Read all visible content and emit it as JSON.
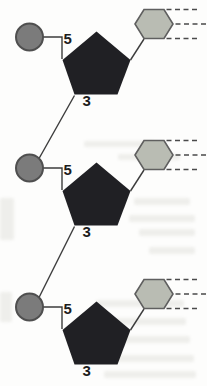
{
  "diagram": {
    "type": "dna-strand-nucleotide-chain",
    "units": [
      {
        "five_label": "5",
        "three_label": "3"
      },
      {
        "five_label": "5",
        "three_label": "3"
      },
      {
        "five_label": "5",
        "three_label": "3"
      }
    ],
    "colors": {
      "background": "#fdfdfc",
      "phosphate_fill": "#7b7b7b",
      "phosphate_stroke": "#4f4f4f",
      "sugar_fill": "#202024",
      "base_fill": "#b9bcb3",
      "base_stroke": "#5f5f5f",
      "bond_line": "#3c3c3c",
      "hbond_dash": "#4a4a4a",
      "label_color": "#1c1c1c"
    }
  }
}
